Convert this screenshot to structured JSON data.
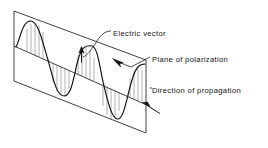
{
  "figure": {
    "type": "physics-diagram",
    "background_color": "#ffffff",
    "line_color": "#111111",
    "hatch_color": "#8a8a8a",
    "labels": [
      {
        "id": "electric-vector",
        "text": "Electric vector",
        "x": 113,
        "y": 36
      },
      {
        "id": "plane-of-polarization",
        "text": "Plane of polarization",
        "x": 152,
        "y": 62
      },
      {
        "id": "direction-of-propagation",
        "text": "Direction of propagation",
        "x": 152,
        "y": 93
      }
    ],
    "plane": {
      "name": "plane-of-polarization",
      "corners": [
        [
          14,
          11
        ],
        [
          146,
          60
        ],
        [
          146,
          133
        ],
        [
          14,
          81
        ]
      ]
    },
    "axis": {
      "name": "direction-of-propagation-axis",
      "start": [
        14,
        46
      ],
      "end": [
        150,
        106
      ],
      "arrowhead": "filled-triangle"
    },
    "wave": {
      "name": "sine-wave",
      "cycles": 2.75,
      "amplitude_px": 35,
      "vector_ticks_per_half_cycle": 5
    },
    "vector_arrow": {
      "name": "electric-vector-arrow",
      "start": [
        81,
        62
      ],
      "end": [
        81,
        47
      ],
      "direction": "up"
    }
  }
}
